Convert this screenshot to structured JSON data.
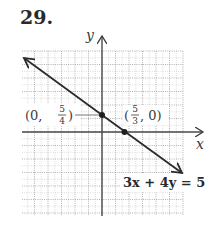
{
  "problem": {
    "number": "29."
  },
  "chart_data": {
    "type": "line",
    "title": "",
    "equation": "3x + 4y = 5",
    "xlabel": "x",
    "ylabel": "y",
    "grid": true,
    "xlim": [
      -6,
      6
    ],
    "ylim": [
      -6,
      6
    ],
    "points": [
      {
        "label": "(0, 5/4)",
        "x": 0,
        "y": 1.25,
        "label_text": "(0,",
        "frac_num": "5",
        "frac_den": "4",
        "label_close": ")"
      },
      {
        "label": "(5/3, 0)",
        "x": 1.6667,
        "y": 0,
        "label_open": "(",
        "frac_num": "5",
        "frac_den": "3",
        "label_text": ", 0)"
      }
    ],
    "series": [
      {
        "name": "3x + 4y = 5",
        "slope": -0.75,
        "intercept": 1.25,
        "x": [
          -5.8,
          5.9
        ],
        "y": [
          5.6,
          -3.18
        ]
      }
    ]
  },
  "labels": {
    "x_axis": "x",
    "y_axis": "y",
    "p1_open": "(0,",
    "p1_num": "5",
    "p1_den": "4",
    "p1_close": ")",
    "p2_open": "(",
    "p2_num": "5",
    "p2_den": "3",
    "p2_close": ", 0)",
    "equation": "3x + 4y = 5"
  },
  "colors": {
    "line": "#2b2b2b",
    "grid": "#b8b8b8",
    "axis": "#3a3a3a"
  }
}
